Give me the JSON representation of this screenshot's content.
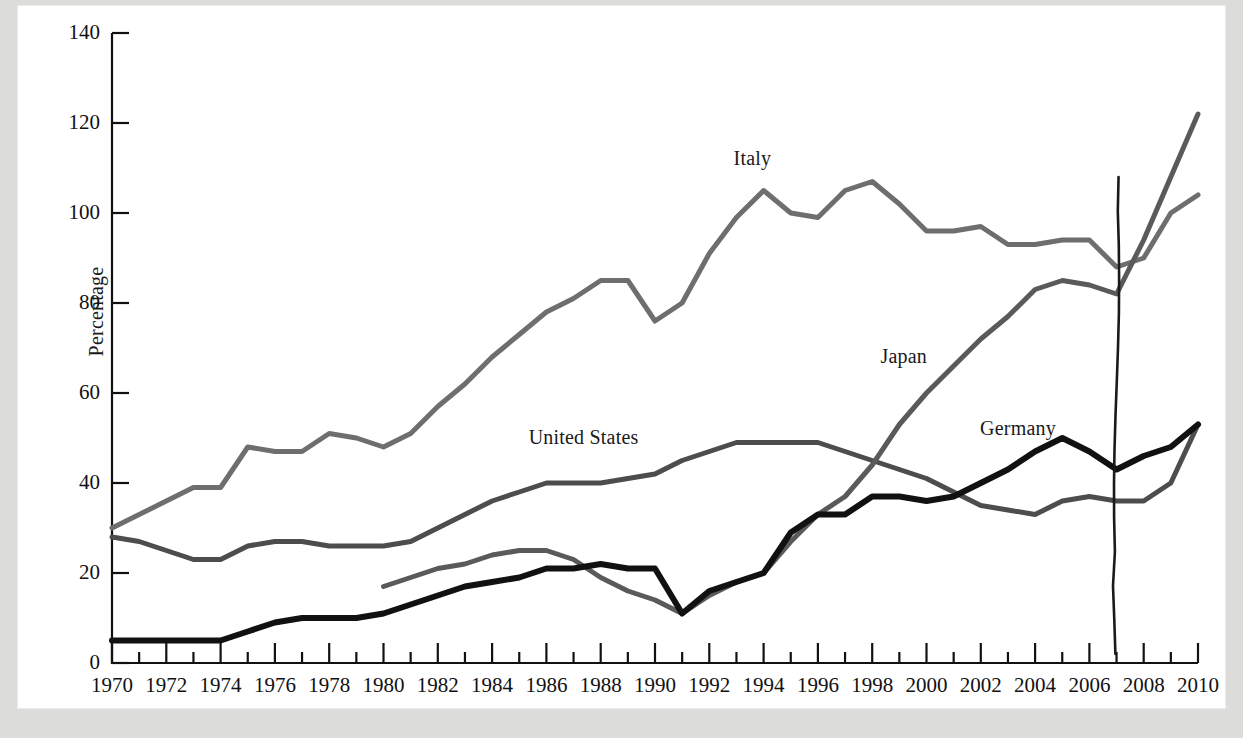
{
  "figure": {
    "ylabel": "Percentage",
    "background_color": "#ffffff",
    "page_color": "#dcdcda"
  },
  "axis": {
    "y_ticks": [
      "0",
      "20",
      "40",
      "60",
      "80",
      "100",
      "120",
      "140"
    ],
    "x_ticks": [
      "1970",
      "1972",
      "1974",
      "1976",
      "1978",
      "1980",
      "1982",
      "1984",
      "1986",
      "1988",
      "1990",
      "1992",
      "1994",
      "1996",
      "1998",
      "2000",
      "2002",
      "2004",
      "2006",
      "2008",
      "2010"
    ]
  },
  "series_labels": {
    "italy": "Italy",
    "japan": "Japan",
    "germany": "Germany",
    "united_states": "United States"
  },
  "annotation": {
    "vertical_mark_year": "2007"
  },
  "chart_data": {
    "type": "line",
    "title": "",
    "xlabel": "",
    "ylabel": "Percentage",
    "xlim": [
      1970,
      2010
    ],
    "ylim": [
      0,
      140
    ],
    "ytick_step": 20,
    "xtick_step": 2,
    "grid": false,
    "legend": "inline-labels",
    "annotations": [
      {
        "text": "Italy",
        "x": 1994,
        "y": 112
      },
      {
        "text": "Japan",
        "x": 2000,
        "y": 68
      },
      {
        "text": "Germany",
        "x": 2004,
        "y": 52
      },
      {
        "text": "United States",
        "x": 1988,
        "y": 50
      },
      {
        "text": "hand-drawn vertical line",
        "x": 2007,
        "y_from": 2,
        "y_to": 108
      }
    ],
    "series": [
      {
        "name": "Italy",
        "color": "#6e6e6e",
        "width": 5,
        "x": [
          1970,
          1971,
          1972,
          1973,
          1974,
          1975,
          1976,
          1977,
          1978,
          1979,
          1980,
          1981,
          1982,
          1983,
          1984,
          1985,
          1986,
          1987,
          1988,
          1989,
          1990,
          1991,
          1992,
          1993,
          1994,
          1995,
          1996,
          1997,
          1998,
          1999,
          2000,
          2001,
          2002,
          2003,
          2004,
          2005,
          2006,
          2007,
          2008,
          2009,
          2010
        ],
        "values": [
          30,
          33,
          36,
          39,
          39,
          48,
          47,
          47,
          51,
          50,
          48,
          51,
          57,
          62,
          68,
          73,
          78,
          81,
          85,
          85,
          76,
          80,
          91,
          99,
          105,
          100,
          99,
          105,
          107,
          102,
          96,
          96,
          97,
          93,
          93,
          94,
          94,
          88,
          90,
          100,
          104
        ]
      },
      {
        "name": "United States",
        "color": "#4d4d4d",
        "width": 5,
        "x": [
          1970,
          1971,
          1972,
          1973,
          1974,
          1975,
          1976,
          1977,
          1978,
          1979,
          1980,
          1981,
          1982,
          1983,
          1984,
          1985,
          1986,
          1987,
          1988,
          1989,
          1990,
          1991,
          1992,
          1993,
          1994,
          1995,
          1996,
          1997,
          1998,
          1999,
          2000,
          2001,
          2002,
          2003,
          2004,
          2005,
          2006,
          2007,
          2008,
          2009,
          2010
        ],
        "values": [
          28,
          27,
          25,
          23,
          23,
          26,
          27,
          27,
          26,
          26,
          26,
          27,
          30,
          33,
          36,
          38,
          40,
          40,
          40,
          41,
          42,
          45,
          47,
          49,
          49,
          49,
          49,
          47,
          45,
          43,
          41,
          38,
          35,
          34,
          33,
          36,
          37,
          36,
          36,
          40,
          53
        ]
      },
      {
        "name": "Japan",
        "color": "#5a5a5a",
        "width": 5,
        "x": [
          1980,
          1981,
          1982,
          1983,
          1984,
          1985,
          1986,
          1987,
          1988,
          1989,
          1990,
          1991,
          1992,
          1993,
          1994,
          1995,
          1996,
          1997,
          1998,
          1999,
          2000,
          2001,
          2002,
          2003,
          2004,
          2005,
          2006,
          2007,
          2008,
          2009,
          2010
        ],
        "values": [
          17,
          19,
          21,
          22,
          24,
          25,
          25,
          23,
          19,
          16,
          14,
          11,
          15,
          18,
          20,
          27,
          33,
          37,
          44,
          53,
          60,
          66,
          72,
          77,
          83,
          85,
          84,
          82,
          94,
          108,
          122
        ]
      },
      {
        "name": "Germany",
        "color": "#111111",
        "width": 6,
        "x": [
          1970,
          1971,
          1972,
          1973,
          1974,
          1975,
          1976,
          1977,
          1978,
          1979,
          1980,
          1981,
          1982,
          1983,
          1984,
          1985,
          1986,
          1987,
          1988,
          1989,
          1990,
          1991,
          1992,
          1993,
          1994,
          1995,
          1996,
          1997,
          1998,
          1999,
          2000,
          2001,
          2002,
          2003,
          2004,
          2005,
          2006,
          2007,
          2008,
          2009,
          2010
        ],
        "values": [
          5,
          5,
          5,
          5,
          5,
          7,
          9,
          10,
          10,
          10,
          11,
          13,
          15,
          17,
          18,
          19,
          21,
          21,
          22,
          21,
          21,
          11,
          16,
          18,
          20,
          29,
          33,
          33,
          37,
          37,
          36,
          37,
          40,
          43,
          47,
          50,
          47,
          43,
          46,
          48,
          53
        ]
      }
    ]
  }
}
